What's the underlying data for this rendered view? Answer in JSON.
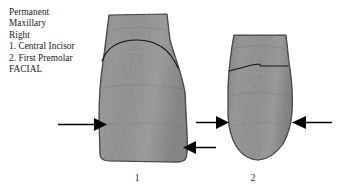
{
  "figure": {
    "caption_lines": [
      "Permanent",
      "Maxillary",
      "Right",
      "1. Central Incisor",
      "2. First Premolar",
      "FACIAL"
    ],
    "background_color": "#ffffff",
    "tooth_fill_color": "#8d8d8d",
    "tooth_outline_color": "#1b1b1b",
    "arrow_color": "#000000"
  },
  "specimens": [
    {
      "number": "1",
      "name": "Central Incisor",
      "arch": "Maxillary",
      "side": "Right",
      "dentition": "Permanent",
      "view": "FACIAL",
      "crown_outline": "broad flaring crown with flat incisal edge",
      "cej_shape": "curved dome",
      "arrows": [
        {
          "label": "arrow-left-incisor",
          "direction": "right",
          "target": "mesial crown contour"
        },
        {
          "label": "arrow-right-incisor",
          "direction": "left",
          "target": "distal crown contour"
        }
      ]
    },
    {
      "number": "2",
      "name": "First Premolar",
      "arch": "Maxillary",
      "side": "Right",
      "dentition": "Permanent",
      "view": "FACIAL",
      "crown_outline": "shorter crown with rounded cusp tip",
      "cej_shape": "nearly straight",
      "arrows": [
        {
          "label": "arrow-left-premolar",
          "direction": "right",
          "target": "mesial crown contour"
        },
        {
          "label": "arrow-right-premolar",
          "direction": "left",
          "target": "distal crown contour"
        }
      ]
    }
  ],
  "figure_numbers": {
    "first": "1",
    "second": "2"
  }
}
